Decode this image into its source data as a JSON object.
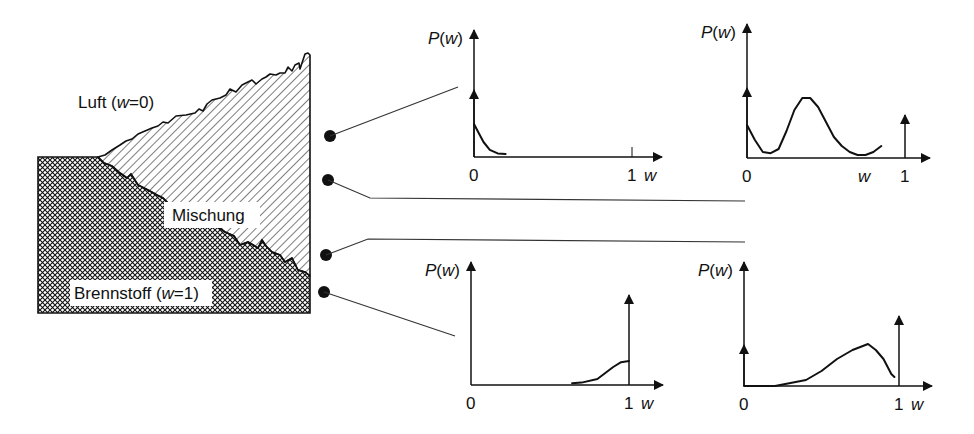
{
  "regions": {
    "air_label": "Luft (",
    "air_var": "w",
    "air_eq": "=0)",
    "mix_label": "Mischung",
    "fuel_label": "Brennstoff (",
    "fuel_var": "w",
    "fuel_eq": "=1)"
  },
  "axis": {
    "ylabel_p": "P(",
    "ylabel_w": "w",
    "ylabel_close": ")",
    "xvar": "w",
    "tick0": "0",
    "tick1": "1"
  },
  "colors": {
    "ink": "#111111",
    "background": "#ffffff"
  },
  "chart_data": [
    {
      "type": "line",
      "title": "Luft (w=0) probe",
      "xlabel": "w",
      "ylabel": "P(w)",
      "xlim": [
        0,
        1
      ],
      "x": [
        0,
        0.03,
        0.06,
        0.1,
        0.15,
        0.2
      ],
      "values": [
        0.55,
        0.4,
        0.25,
        0.12,
        0.06,
        0.05
      ],
      "delta_peaks": [
        {
          "w": 0,
          "kind": "dirac"
        }
      ]
    },
    {
      "type": "line",
      "title": "Mischung probe (upper)",
      "xlabel": "w",
      "ylabel": "P(w)",
      "xlim": [
        0,
        1
      ],
      "x": [
        0,
        0.05,
        0.1,
        0.15,
        0.2,
        0.25,
        0.3,
        0.35,
        0.4,
        0.45,
        0.5,
        0.55,
        0.6,
        0.65,
        0.7,
        0.75,
        0.8,
        0.85
      ],
      "values": [
        0.55,
        0.3,
        0.1,
        0.08,
        0.15,
        0.45,
        0.8,
        1.0,
        1.0,
        0.85,
        0.6,
        0.35,
        0.2,
        0.1,
        0.05,
        0.05,
        0.1,
        0.2
      ],
      "delta_peaks": [
        {
          "w": 0,
          "kind": "dirac"
        },
        {
          "w": 1,
          "kind": "dirac"
        }
      ]
    },
    {
      "type": "line",
      "title": "Brennstoff probe",
      "xlabel": "w",
      "ylabel": "P(w)",
      "xlim": [
        0,
        1
      ],
      "x": [
        0.64,
        0.7,
        0.8,
        0.9,
        0.95,
        1.0
      ],
      "values": [
        0.03,
        0.04,
        0.1,
        0.3,
        0.38,
        0.4
      ],
      "delta_peaks": [
        {
          "w": 1,
          "kind": "dirac"
        }
      ]
    },
    {
      "type": "line",
      "title": "Mischung probe (lower)",
      "xlabel": "w",
      "ylabel": "P(w)",
      "xlim": [
        0,
        1
      ],
      "x": [
        0,
        0.1,
        0.2,
        0.3,
        0.4,
        0.5,
        0.6,
        0.7,
        0.75,
        0.8,
        0.85,
        0.9,
        0.95,
        0.97
      ],
      "values": [
        0.0,
        0.0,
        0.0,
        0.05,
        0.1,
        0.25,
        0.45,
        0.6,
        0.65,
        0.7,
        0.6,
        0.45,
        0.2,
        0.15
      ],
      "delta_peaks": [
        {
          "w": 0,
          "kind": "dirac"
        },
        {
          "w": 1,
          "kind": "dirac"
        }
      ]
    }
  ]
}
